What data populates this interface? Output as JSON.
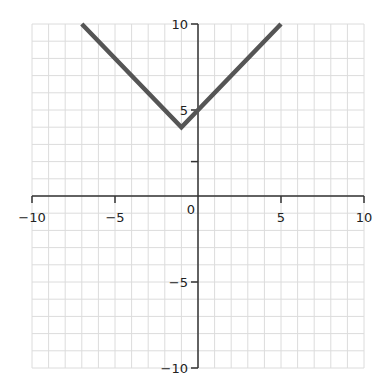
{
  "chart_data": {
    "type": "line",
    "title": "",
    "xlabel": "",
    "ylabel": "",
    "xlim": [
      -10,
      10
    ],
    "ylim": [
      -10,
      10
    ],
    "grid": true,
    "grid_step": 1,
    "x_tick_labels": [
      "-10",
      "-5",
      "0",
      "5",
      "10"
    ],
    "x_ticks": [
      -10,
      -5,
      5,
      10
    ],
    "y_tick_labels": [
      "10",
      "5",
      "-5",
      "-10"
    ],
    "y_ticks": [
      10,
      5,
      2,
      -5,
      -10
    ],
    "origin_label": "0",
    "series": [
      {
        "name": "y = |x + 1| + 4",
        "x": [
          -7,
          -1,
          5
        ],
        "y": [
          10,
          4,
          10
        ],
        "color": "#555555"
      }
    ],
    "vertex": {
      "x": -1,
      "y": 4
    }
  },
  "colors": {
    "grid": "#dcdcdc",
    "axis": "#333333",
    "line": "#555555"
  }
}
